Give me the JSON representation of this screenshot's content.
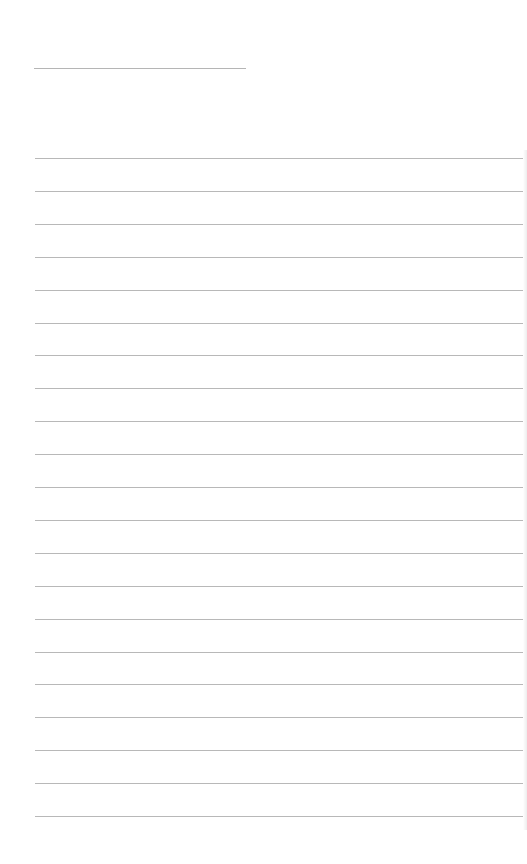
{
  "page": {
    "type": "blank lined writing page",
    "title_line": {
      "text": ""
    },
    "rules": {
      "count": 21,
      "first_y": 158,
      "spacing": 32.9,
      "color": "#b8b8b8",
      "entries": [
        "",
        "",
        "",
        "",
        "",
        "",
        "",
        "",
        "",
        "",
        "",
        "",
        "",
        "",
        "",
        "",
        "",
        "",
        "",
        "",
        ""
      ]
    }
  }
}
